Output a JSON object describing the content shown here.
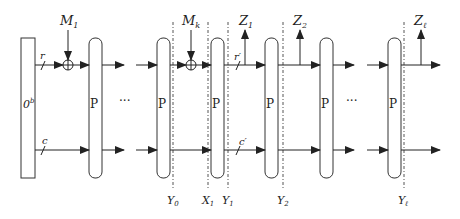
{
  "colors": {
    "stroke": "#333333",
    "box_fill": "#ffffff",
    "dash": "#555555"
  },
  "init_block": {
    "label": "0",
    "sup": "b"
  },
  "permutation_label": "P",
  "ellipsis": "···",
  "rate_label": "r",
  "capacity_label": "c",
  "rate_prime_label": "r′",
  "capacity_prime_label": "c′",
  "inputs": [
    {
      "name": "M",
      "sub": "1"
    },
    {
      "name": "M",
      "sub": "k"
    }
  ],
  "outputs": [
    {
      "name": "Z",
      "sub": "1"
    },
    {
      "name": "Z",
      "sub": "2"
    },
    {
      "name": "Z",
      "sub": "ℓ"
    }
  ],
  "state_markers": [
    {
      "name": "Y",
      "sub": "0"
    },
    {
      "name": "X",
      "sub": "1"
    },
    {
      "name": "Y",
      "sub": "1"
    },
    {
      "name": "Y",
      "sub": "2"
    },
    {
      "name": "Y",
      "sub": "ℓ"
    }
  ]
}
